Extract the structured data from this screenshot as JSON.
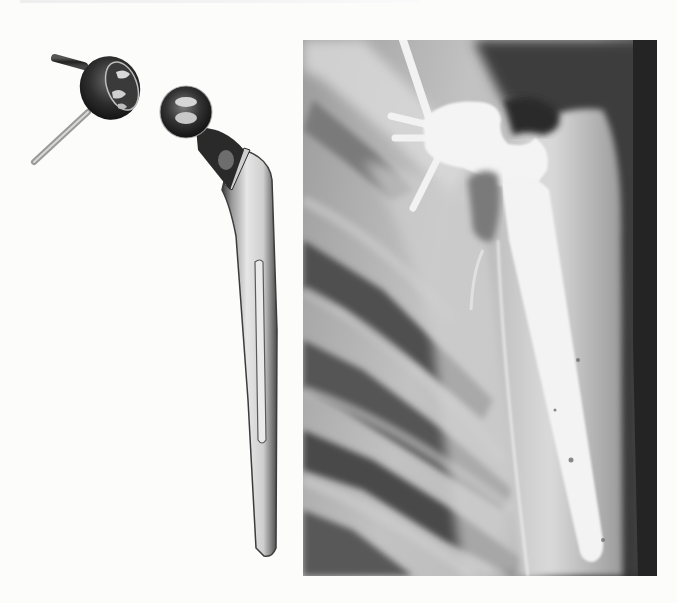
{
  "page": {
    "heading_clipped": "",
    "background": "#fcfcfb"
  },
  "figure": {
    "left_panel": {
      "description": "Total shoulder prosthesis components photographed on white background",
      "components": [
        {
          "name": "glenoid-component",
          "features": [
            "hemispherical cup",
            "two short pegs",
            "one long screw/peg"
          ]
        },
        {
          "name": "humeral-component",
          "features": [
            "spherical head",
            "neck",
            "collar",
            "long tapered stem with longitudinal flute"
          ]
        }
      ]
    },
    "right_panel": {
      "description": "Radiograph of shoulder with implanted total shoulder prosthesis",
      "colors": {
        "dark": "#2b2b2b",
        "mid": "#8a8a8a",
        "bright": "#f4f4f4"
      }
    }
  }
}
